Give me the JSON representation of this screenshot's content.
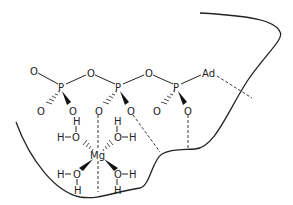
{
  "diagram": {
    "title": "",
    "atoms": {
      "phosphate1": {
        "P": "P",
        "O_top_left": "O",
        "O_lower_left": "O",
        "O_lower_right": "O"
      },
      "bridge1": "O",
      "phosphate2": {
        "P": "P",
        "O_lower_left": "O",
        "O_lower_right": "O"
      },
      "bridge2": "O",
      "phosphate3": {
        "P": "P",
        "O_lower_left": "O",
        "O_lower_right": "O"
      },
      "adenosine": "Ad",
      "metal": "Mg",
      "waters": [
        {
          "O": "O",
          "H_top": "H",
          "H_side": "H"
        },
        {
          "O": "O",
          "H_top": "H",
          "H_side": "H"
        },
        {
          "O": "O",
          "H_bottom": "H",
          "H_side": "H"
        },
        {
          "O": "O",
          "H_bottom": "H",
          "H_side": "H"
        }
      ]
    },
    "colors": {
      "ink": "#222222",
      "background": "#ffffff"
    }
  }
}
